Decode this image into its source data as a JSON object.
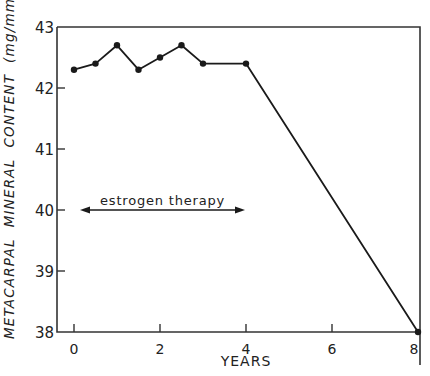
{
  "chart_data": {
    "type": "line",
    "title": "",
    "xlabel": "YEARS",
    "ylabel": "METACARPAL  MINERAL  CONTENT  (mg/mm)",
    "xlim": [
      0,
      8
    ],
    "ylim": [
      38,
      43
    ],
    "x_ticks": [
      0,
      2,
      4,
      6,
      8
    ],
    "y_ticks": [
      38,
      39,
      40,
      41,
      42,
      43
    ],
    "grid": false,
    "series": [
      {
        "name": "Metacarpal mineral content",
        "x": [
          0,
          0.5,
          1.0,
          1.5,
          2.0,
          2.5,
          3.0,
          4.0,
          8.0
        ],
        "y": [
          42.3,
          42.4,
          42.7,
          42.3,
          42.5,
          42.7,
          42.4,
          42.4,
          38.0
        ]
      }
    ],
    "annotations": [
      {
        "text": "estrogen therapy",
        "type": "double-arrow",
        "x_start": 0,
        "x_end": 4,
        "y": 40
      }
    ]
  },
  "labels": {
    "xlabel": "YEARS",
    "ylabel": "METACARPAL  MINERAL  CONTENT  (mg/mm)",
    "annotation": "estrogen therapy"
  },
  "style": {
    "line_color": "#1a1a1a",
    "axis_color": "#333333"
  }
}
